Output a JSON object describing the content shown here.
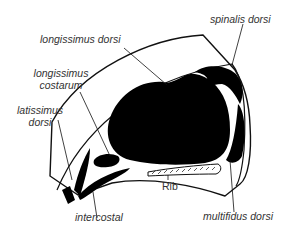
{
  "diagram": {
    "type": "anatomical cross-section",
    "labels": {
      "longissimus_dorsi": "longissimus dorsi",
      "spinalis_dorsi": "spinalis dorsi",
      "longissimus_costarum_1": "longissimus",
      "longissimus_costarum_2": "costarum",
      "latissimus_dorsi_1": "latissimus",
      "latissimus_dorsi_2": "dorsi",
      "rib": "Rib",
      "intercostal": "intercostal",
      "multifidus_dorsi": "multifidus dorsi"
    },
    "colors": {
      "muscle": "#000000",
      "outline": "#111111",
      "label_text": "#333333",
      "background": "#ffffff"
    }
  }
}
